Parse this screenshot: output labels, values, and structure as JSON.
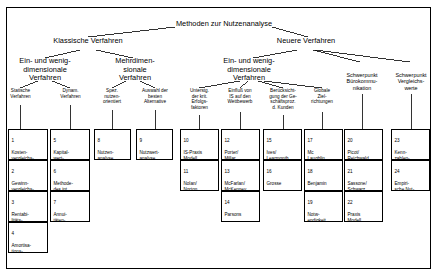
{
  "diagram": {
    "type": "tree",
    "root": {
      "label": "Methoden zur Nutzenanalyse"
    },
    "level1": [
      {
        "label": "Klassische Verfahren"
      },
      {
        "label": "Neuere Verfahren"
      }
    ],
    "level2": [
      {
        "label": "Ein- und wenig-\ndimensionale\nVerfahren"
      },
      {
        "label": "Mehrdimen-\nsionale\nVerfahren"
      },
      {
        "label": "Ein- und wenig-\ndimensionale\nVerfahren"
      },
      {
        "label": "Schwerpunkt\nBürokommu-\nnikation"
      },
      {
        "label": "Schwerpunkt\nVergleichs-\nwerte"
      }
    ],
    "level3": [
      {
        "label": "Statische\nVerfahren"
      },
      {
        "label": "Dynam.\nVerfahren"
      },
      {
        "label": "Spez.\nnutzen-\norientiert"
      },
      {
        "label": "Auswahl der\nbesten\nAlternative"
      },
      {
        "label": "Unterstg.\nder krit.\nErfolgs-\nfaktoren"
      },
      {
        "label": "Einfluß von\nIS auf den\nWettbewerb"
      },
      {
        "label": "Berücksicht-\ngung der Ge-\nschäftsproz.\nd. Kunden"
      },
      {
        "label": "Globale\nZiel-\nrichtungen"
      }
    ],
    "leaves": [
      {
        "num": "1",
        "label": "Kosten-\nvergleichs-\nrechnung"
      },
      {
        "num": "2",
        "label": "Gewinn-\nvergleichs-\nrechnung"
      },
      {
        "num": "3",
        "label": "Rentabi-\nlitäts-\nrechnung"
      },
      {
        "num": "4",
        "label": "Amortisa-\ntions-\nrechnung"
      },
      {
        "num": "5",
        "label": "Kapital-\nwert-\nmethode"
      },
      {
        "num": "6",
        "label": "Methode-\ndes int.\nZinsfußes"
      },
      {
        "num": "7",
        "label": "Annui-\ntäten-\nmethode"
      },
      {
        "num": "8",
        "label": "Nutzen-\nanalyse"
      },
      {
        "num": "9",
        "label": "Nutzwert-\nanalyse"
      },
      {
        "num": "10",
        "label": "IS-Praxis\nModell"
      },
      {
        "num": "11",
        "label": "Nolan/\nNorton"
      },
      {
        "num": "12",
        "label": "Porter/\nMillar"
      },
      {
        "num": "13",
        "label": "McFarlan/\nMcKenney"
      },
      {
        "num": "14",
        "label": "Parsons"
      },
      {
        "num": "15",
        "label": "Ives/\nLearmonth"
      },
      {
        "num": "16",
        "label": "Grosse"
      },
      {
        "num": "17",
        "label": "Mc\nLaughlin"
      },
      {
        "num": "18",
        "label": "Benjamin"
      },
      {
        "num": "19",
        "label": "Notw-\nendigkeit"
      },
      {
        "num": "20",
        "label": "Picot/\nReichwald"
      },
      {
        "num": "21",
        "label": "Sassone/\nSchwarz"
      },
      {
        "num": "22",
        "label": "Praxis\nModell"
      },
      {
        "num": "23",
        "label": "Kenn-\nzahlen-\nmethode"
      },
      {
        "num": "24",
        "label": "Empiri-\nsche Nut-\nzendaten"
      }
    ],
    "colors": {
      "line": "#000000",
      "box_border": "#000000",
      "background": "#ffffff"
    }
  }
}
